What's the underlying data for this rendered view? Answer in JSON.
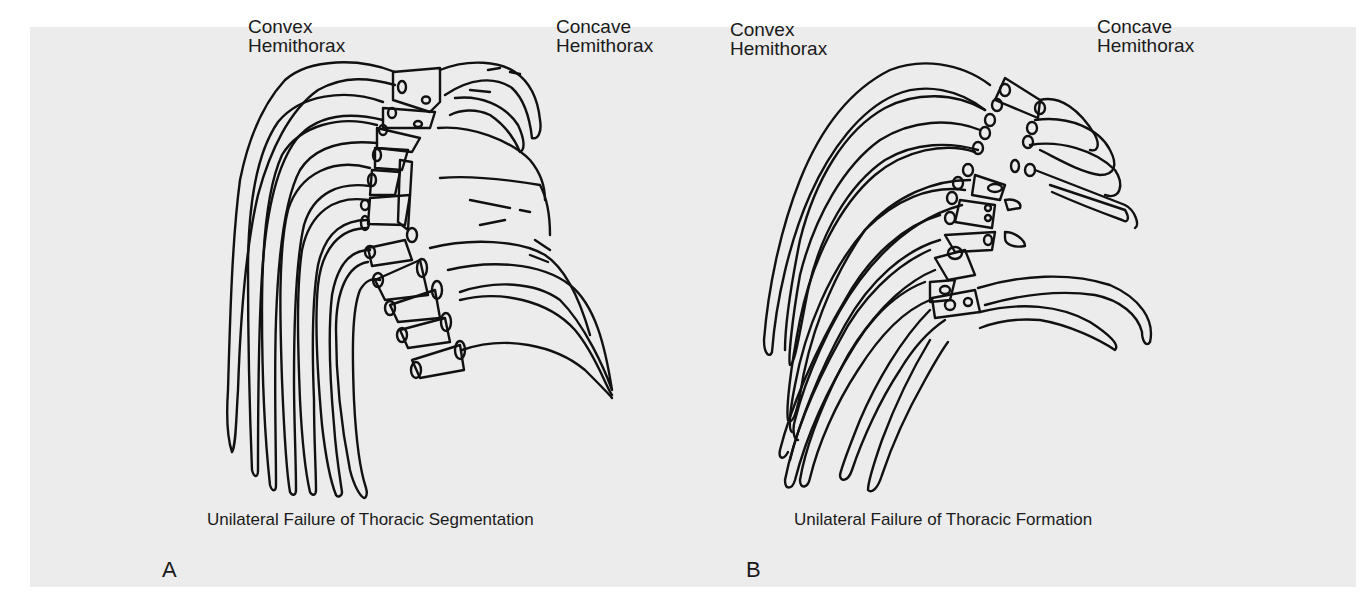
{
  "figure": {
    "panels": [
      {
        "letter": "A",
        "left_label": [
          "Convex",
          "Hemithorax"
        ],
        "right_label": [
          "Concave",
          "Hemithorax"
        ],
        "caption": "Unilateral Failure of Thoracic Segmentation"
      },
      {
        "letter": "B",
        "left_label": [
          "Convex",
          "Hemithorax"
        ],
        "right_label": [
          "Concave",
          "Hemithorax"
        ],
        "caption": "Unilateral Failure of Thoracic Formation"
      }
    ],
    "colors": {
      "background": "#ffffff",
      "panel": "#ececec",
      "line": "#111111"
    }
  }
}
